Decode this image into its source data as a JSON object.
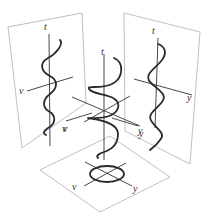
{
  "figure": {
    "panels": {
      "left": {
        "name": "v-t projection",
        "axes": {
          "vertical": "t",
          "horizontal": "v"
        },
        "horizontal_label_top": "v",
        "horizontal_label_bottom": "v",
        "curve": "sine wave"
      },
      "right": {
        "name": "y-t projection",
        "axes": {
          "vertical": "t",
          "horizontal": "y"
        },
        "horizontal_label_top": "y",
        "horizontal_label_bottom": "y",
        "curve": "sine wave"
      },
      "bottom": {
        "name": "v-y projection",
        "axes": {
          "left": "v",
          "right": "y"
        },
        "curve": "circle"
      }
    },
    "center": {
      "name": "helix",
      "axes": {
        "vertical": "t",
        "left": "v",
        "right": "y"
      }
    }
  },
  "labels": {
    "left_t": "t",
    "left_v_upper": "v",
    "left_v_lower": "v",
    "center_t": "t",
    "center_v": "v",
    "center_y": "y",
    "right_t": "t",
    "right_y_upper": "y",
    "right_y_lower": "y",
    "bottom_v": "v",
    "bottom_y": "y"
  },
  "colors": {
    "panel_border": "#b8b8b8",
    "curve": "#2a2a2a",
    "axis": "#333333",
    "background": "#ffffff"
  }
}
